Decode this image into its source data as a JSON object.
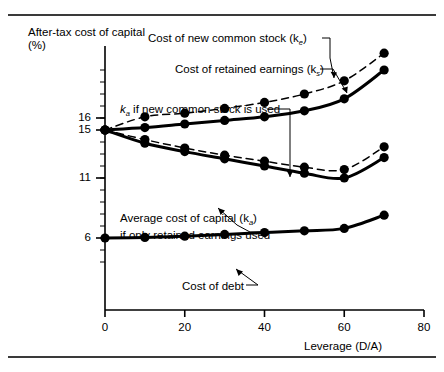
{
  "figure": {
    "axis_y_title": "After-tax cost of capital (%)",
    "axis_x_title": "Leverage (D/A)"
  },
  "annotations": {
    "new_stock": "Cost of new common stock (k",
    "new_stock_sub": "e",
    "new_stock_tail": ")",
    "retained": "Cost of retained earnings (k",
    "retained_sub": "s",
    "retained_tail": ")",
    "ke_new_lead": "k",
    "ke_new_sub": "a",
    "ke_new_tail": " if new common stock is used",
    "avg_line1": "Average cost of capital (k",
    "avg_sub": "a",
    "avg_line1_tail": ")",
    "avg_line2": "if only retained earnings used",
    "debt": "Cost of debt"
  },
  "chart_data": {
    "type": "line",
    "title": "",
    "xlabel": "Leverage (D/A)",
    "ylabel": "After-tax cost of capital (%)",
    "xlim": [
      0,
      80
    ],
    "ylim": [
      0,
      22
    ],
    "xticks": [
      0,
      20,
      40,
      60,
      80
    ],
    "yticks": [
      6,
      11,
      15,
      16
    ],
    "grid": false,
    "legend": "none (inline annotations with leader lines)",
    "x": [
      0,
      10,
      20,
      30,
      40,
      50,
      60,
      70
    ],
    "series": [
      {
        "name": "Cost of new common stock (ke)",
        "style": "dashed",
        "markers": true,
        "values": [
          15.0,
          16.1,
          16.4,
          16.8,
          17.3,
          18.0,
          19.1,
          21.4
        ]
      },
      {
        "name": "Cost of retained earnings (ks)",
        "style": "solid",
        "markers": true,
        "values": [
          15.0,
          15.2,
          15.5,
          15.8,
          16.1,
          16.6,
          17.6,
          20.0
        ]
      },
      {
        "name": "ka if new common stock is used",
        "style": "dashed",
        "markers": true,
        "values": [
          15.0,
          14.2,
          13.5,
          12.9,
          12.4,
          11.9,
          11.7,
          13.6
        ]
      },
      {
        "name": "Average cost of capital (ka) if only retained earnings used",
        "style": "solid",
        "markers": true,
        "values": [
          15.0,
          13.9,
          13.2,
          12.6,
          12.0,
          11.4,
          11.0,
          12.7
        ]
      },
      {
        "name": "Cost of debt",
        "style": "solid",
        "markers": true,
        "values": [
          6.0,
          6.05,
          6.15,
          6.3,
          6.45,
          6.6,
          6.8,
          7.9
        ]
      }
    ]
  }
}
